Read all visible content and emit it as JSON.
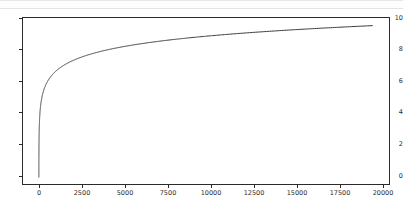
{
  "figure": {
    "background_color": "#ffffff",
    "frame_color": "#2b2b2b",
    "top_band_color": "#fdfdfd"
  },
  "chart_data": {
    "type": "line",
    "title": "",
    "xlabel": "",
    "ylabel": "",
    "xlim": [
      -950,
      21000
    ],
    "ylim": [
      -0.45,
      10.4
    ],
    "grid": false,
    "legend": null,
    "line_color": "#3a3a3a",
    "line_width": 1,
    "xticks": [
      0,
      2500,
      5000,
      7500,
      10000,
      12500,
      15000,
      17500,
      20000
    ],
    "xticklabels": [
      "0",
      "2500",
      "5000",
      "7500",
      "10000",
      "12500",
      "15000",
      "17500",
      "20000"
    ],
    "yticks": [
      0,
      2,
      4,
      6,
      8,
      10
    ],
    "yticklabels": [
      "0",
      "2",
      "4",
      "6",
      "8",
      "10"
    ],
    "series": [
      {
        "name": "ln(x)",
        "x": [
          1,
          2,
          3,
          5,
          8,
          12,
          18,
          27,
          40,
          60,
          90,
          135,
          200,
          300,
          450,
          675,
          1000,
          1500,
          2250,
          3375,
          5000,
          7500,
          10000,
          12500,
          15000,
          17500,
          20000
        ],
        "y": [
          0.0,
          0.69,
          1.1,
          1.61,
          2.08,
          2.48,
          2.89,
          3.3,
          3.69,
          4.09,
          4.5,
          4.91,
          5.3,
          5.7,
          6.11,
          6.51,
          6.91,
          7.31,
          7.72,
          8.12,
          8.52,
          8.92,
          9.21,
          9.43,
          9.62,
          9.77,
          9.9
        ]
      }
    ]
  }
}
